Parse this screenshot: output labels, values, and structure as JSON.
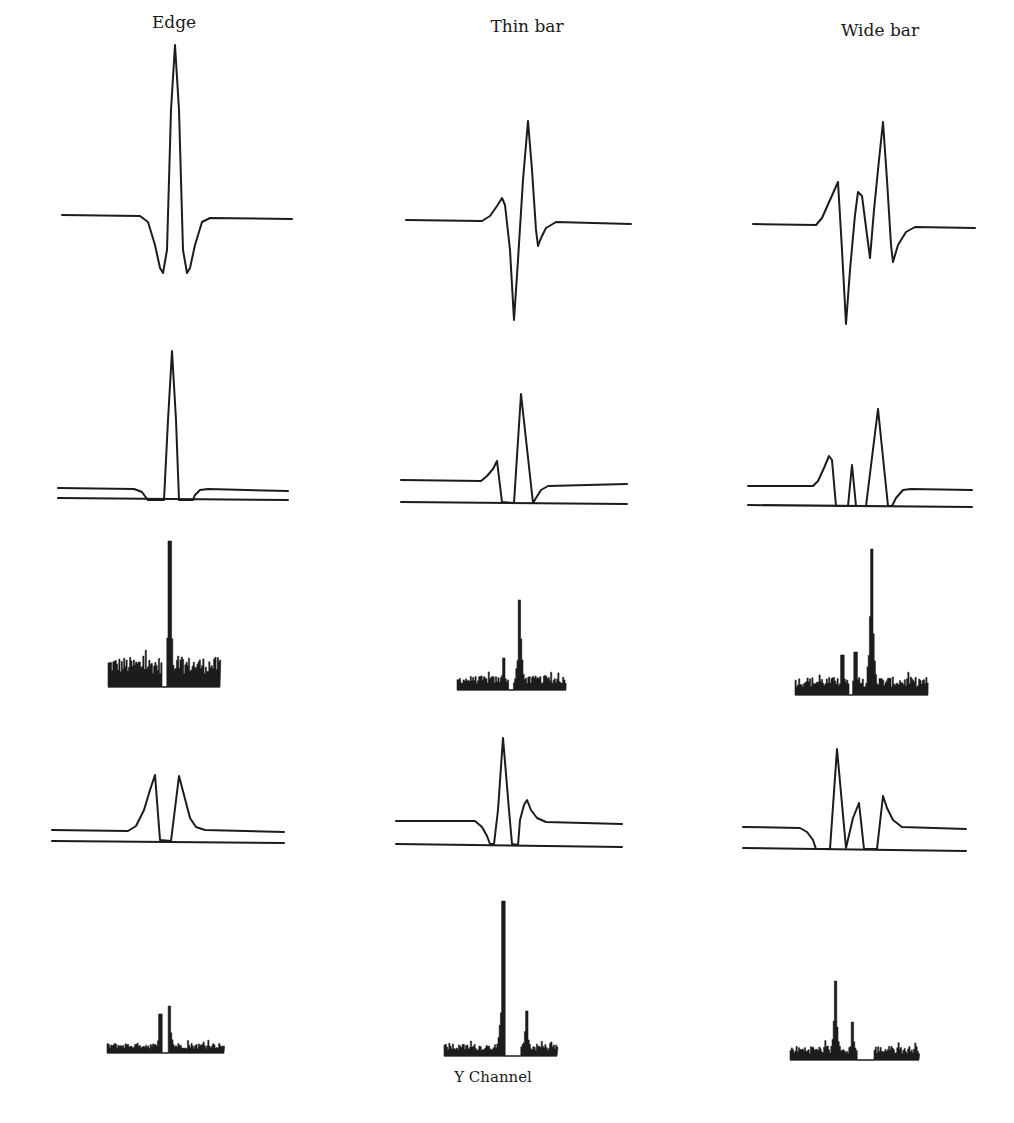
{
  "figure": {
    "columns": [
      {
        "title": "Edge",
        "x": 174,
        "y": 12
      },
      {
        "title": "Thin bar",
        "x": 527,
        "y": 16
      },
      {
        "title": "Wide bar",
        "x": 880,
        "y": 20
      }
    ],
    "caption": {
      "text": "Y Channel",
      "x": 493,
      "y": 1068
    }
  },
  "chart_data": {
    "type": "line",
    "title": "",
    "columns": [
      "Edge",
      "Thin bar",
      "Wide bar"
    ],
    "rows": [
      "filter response",
      "positive rectified response",
      "positive response histogram",
      "negative rectified response",
      "negative response histogram"
    ],
    "caption": "Y Channel",
    "panels": [
      {
        "row": 0,
        "col": "Edge",
        "kind": "curve",
        "points": [
          [
            62,
            215
          ],
          [
            140,
            216
          ],
          [
            148,
            222
          ],
          [
            155,
            245
          ],
          [
            160,
            268
          ],
          [
            163,
            273
          ],
          [
            167,
            250
          ],
          [
            171,
            110
          ],
          [
            175,
            45
          ],
          [
            179,
            110
          ],
          [
            183,
            250
          ],
          [
            187,
            273
          ],
          [
            190,
            268
          ],
          [
            195,
            245
          ],
          [
            202,
            222
          ],
          [
            210,
            218
          ],
          [
            292,
            219
          ]
        ]
      },
      {
        "row": 0,
        "col": "Thin bar",
        "kind": "curve",
        "points": [
          [
            406,
            220
          ],
          [
            482,
            221
          ],
          [
            490,
            216
          ],
          [
            497,
            206
          ],
          [
            502,
            198
          ],
          [
            505,
            205
          ],
          [
            510,
            250
          ],
          [
            514,
            320
          ],
          [
            518,
            260
          ],
          [
            523,
            180
          ],
          [
            528,
            121
          ],
          [
            532,
            170
          ],
          [
            536,
            230
          ],
          [
            538,
            246
          ],
          [
            541,
            238
          ],
          [
            546,
            228
          ],
          [
            556,
            222
          ],
          [
            631,
            224
          ]
        ]
      },
      {
        "row": 0,
        "col": "Wide bar",
        "kind": "curve",
        "points": [
          [
            753,
            224
          ],
          [
            816,
            225
          ],
          [
            822,
            218
          ],
          [
            830,
            200
          ],
          [
            838,
            182
          ],
          [
            842,
            250
          ],
          [
            846,
            324
          ],
          [
            850,
            270
          ],
          [
            855,
            215
          ],
          [
            858,
            192
          ],
          [
            862,
            196
          ],
          [
            867,
            235
          ],
          [
            870,
            258
          ],
          [
            874,
            210
          ],
          [
            879,
            160
          ],
          [
            883,
            122
          ],
          [
            887,
            180
          ],
          [
            891,
            245
          ],
          [
            893,
            262
          ],
          [
            898,
            245
          ],
          [
            906,
            232
          ],
          [
            915,
            227
          ],
          [
            975,
            228
          ]
        ]
      },
      {
        "row": 1,
        "col": "Edge",
        "kind": "curve",
        "points": [
          [
            58,
            488
          ],
          [
            134,
            489
          ],
          [
            142,
            492
          ],
          [
            147,
            499
          ],
          [
            148,
            500
          ],
          [
            164,
            500
          ],
          [
            168,
            420
          ],
          [
            172,
            351
          ],
          [
            176,
            420
          ],
          [
            179,
            500
          ],
          [
            193,
            500
          ],
          [
            195,
            495
          ],
          [
            200,
            490
          ],
          [
            208,
            489
          ],
          [
            288,
            491
          ]
        ]
      },
      {
        "row": 1,
        "col": "Edge",
        "kind": "line",
        "points": [
          [
            58,
            498
          ],
          [
            288,
            500
          ]
        ]
      },
      {
        "row": 1,
        "col": "Thin bar",
        "kind": "curve",
        "points": [
          [
            401,
            480
          ],
          [
            481,
            481
          ],
          [
            487,
            476
          ],
          [
            493,
            469
          ],
          [
            497,
            461
          ],
          [
            502,
            502
          ],
          [
            514,
            503
          ],
          [
            521,
            394
          ],
          [
            533,
            503
          ],
          [
            536,
            498
          ],
          [
            541,
            490
          ],
          [
            548,
            486
          ],
          [
            627,
            484
          ]
        ]
      },
      {
        "row": 1,
        "col": "Thin bar",
        "kind": "line",
        "points": [
          [
            401,
            502
          ],
          [
            627,
            504
          ]
        ]
      },
      {
        "row": 1,
        "col": "Wide bar",
        "kind": "curve",
        "points": [
          [
            748,
            486
          ],
          [
            813,
            486
          ],
          [
            818,
            481
          ],
          [
            824,
            468
          ],
          [
            829,
            456
          ],
          [
            832,
            460
          ],
          [
            836,
            506
          ],
          [
            848,
            506
          ],
          [
            852,
            465
          ],
          [
            856,
            506
          ],
          [
            866,
            506
          ],
          [
            878,
            409
          ],
          [
            888,
            506
          ],
          [
            892,
            506
          ],
          [
            896,
            498
          ],
          [
            903,
            490
          ],
          [
            911,
            489
          ],
          [
            972,
            490
          ]
        ]
      },
      {
        "row": 1,
        "col": "Wide bar",
        "kind": "line",
        "points": [
          [
            748,
            505
          ],
          [
            972,
            507
          ]
        ]
      },
      {
        "row": 3,
        "col": "Edge",
        "kind": "curve",
        "points": [
          [
            52,
            830
          ],
          [
            128,
            831
          ],
          [
            136,
            826
          ],
          [
            144,
            810
          ],
          [
            150,
            790
          ],
          [
            155,
            775
          ],
          [
            160,
            840
          ],
          [
            171,
            841
          ],
          [
            179,
            776
          ],
          [
            184,
            795
          ],
          [
            190,
            818
          ],
          [
            196,
            827
          ],
          [
            205,
            830
          ],
          [
            284,
            832
          ]
        ]
      },
      {
        "row": 3,
        "col": "Edge",
        "kind": "line",
        "points": [
          [
            52,
            841
          ],
          [
            284,
            843
          ]
        ]
      },
      {
        "row": 3,
        "col": "Thin bar",
        "kind": "curve",
        "points": [
          [
            396,
            821
          ],
          [
            475,
            821
          ],
          [
            482,
            827
          ],
          [
            487,
            836
          ],
          [
            490,
            844
          ],
          [
            494,
            844
          ],
          [
            498,
            810
          ],
          [
            503,
            738
          ],
          [
            509,
            810
          ],
          [
            512,
            844
          ],
          [
            518,
            845
          ],
          [
            520,
            820
          ],
          [
            524,
            805
          ],
          [
            527,
            800
          ],
          [
            531,
            810
          ],
          [
            537,
            818
          ],
          [
            546,
            822
          ],
          [
            622,
            824
          ]
        ]
      },
      {
        "row": 3,
        "col": "Thin bar",
        "kind": "line",
        "points": [
          [
            396,
            844
          ],
          [
            622,
            847
          ]
        ]
      },
      {
        "row": 3,
        "col": "Wide bar",
        "kind": "curve",
        "points": [
          [
            743,
            827
          ],
          [
            800,
            828
          ],
          [
            807,
            832
          ],
          [
            813,
            840
          ],
          [
            816,
            849
          ],
          [
            830,
            849
          ],
          [
            837,
            749
          ],
          [
            846,
            848
          ],
          [
            853,
            818
          ],
          [
            859,
            803
          ],
          [
            864,
            849
          ],
          [
            877,
            849
          ],
          [
            883,
            796
          ],
          [
            887,
            808
          ],
          [
            893,
            820
          ],
          [
            902,
            827
          ],
          [
            966,
            829
          ]
        ]
      },
      {
        "row": 3,
        "col": "Wide bar",
        "kind": "line",
        "points": [
          [
            743,
            848
          ],
          [
            966,
            851
          ]
        ]
      },
      {
        "row": 2,
        "col": "Edge",
        "kind": "histogram",
        "x0": 108,
        "x1": 220,
        "baseline": 687,
        "peaks": [
          {
            "x": 169,
            "top": 541
          }
        ],
        "noise_level": 30,
        "gap": [
          161,
          166
        ]
      },
      {
        "row": 2,
        "col": "Thin bar",
        "kind": "histogram",
        "x0": 457,
        "x1": 566,
        "baseline": 690,
        "peaks": [
          {
            "x": 519,
            "top": 600
          },
          {
            "x": 503,
            "top": 658
          }
        ],
        "noise_level": 14,
        "gap": [
          508,
          513
        ]
      },
      {
        "row": 2,
        "col": "Wide bar",
        "kind": "histogram",
        "x0": 795,
        "x1": 928,
        "baseline": 695,
        "peaks": [
          {
            "x": 871,
            "top": 549
          },
          {
            "x": 842,
            "top": 655
          },
          {
            "x": 855,
            "top": 652
          }
        ],
        "noise_level": 18,
        "gap": [
          848,
          852
        ]
      },
      {
        "row": 4,
        "col": "Edge",
        "kind": "histogram",
        "x0": 107,
        "x1": 224,
        "baseline": 1053,
        "peaks": [
          {
            "x": 160,
            "top": 1014
          },
          {
            "x": 169,
            "top": 1006
          }
        ],
        "noise_level": 10,
        "gap": [
          162,
          167
        ]
      },
      {
        "row": 4,
        "col": "Thin bar",
        "kind": "histogram",
        "x0": 444,
        "x1": 557,
        "baseline": 1056,
        "peaks": [
          {
            "x": 503,
            "top": 901
          },
          {
            "x": 526,
            "top": 1011
          }
        ],
        "noise_level": 12,
        "gap": [
          505,
          520
        ]
      },
      {
        "row": 4,
        "col": "Wide bar",
        "kind": "histogram",
        "x0": 790,
        "x1": 919,
        "baseline": 1060,
        "peaks": [
          {
            "x": 835,
            "top": 981
          },
          {
            "x": 852,
            "top": 1022
          }
        ],
        "noise_level": 14,
        "gap": [
          857,
          873
        ]
      }
    ]
  }
}
